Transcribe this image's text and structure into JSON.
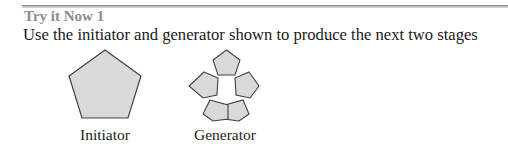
{
  "section": {
    "title": "Try it Now 1",
    "instruction": "Use the initiator and generator shown to produce the next two stages"
  },
  "figures": {
    "initiator": {
      "label": "Initiator",
      "shape": "pentagon",
      "fill": "#d9d9d9",
      "stroke": "#404040"
    },
    "generator": {
      "label": "Generator",
      "shape": "five-pentagon-ring",
      "fill": "#d9d9d9",
      "stroke": "#404040"
    }
  }
}
